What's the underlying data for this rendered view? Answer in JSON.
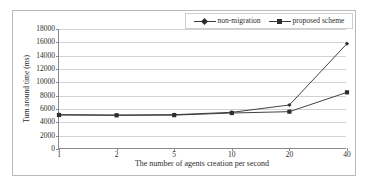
{
  "chart_data": {
    "type": "line",
    "title": "",
    "xlabel": "The number of agents creation per second",
    "ylabel": "Turn around time (ms)",
    "categories": [
      "1",
      "2",
      "5",
      "10",
      "20",
      "40"
    ],
    "ylim": [
      0,
      18000
    ],
    "yticks": [
      0,
      2000,
      4000,
      6000,
      8000,
      10000,
      12000,
      14000,
      16000,
      18000
    ],
    "ytick_labels": [
      "0",
      "2000",
      "4000",
      "6000",
      "8000",
      "10000",
      "12000",
      "14000",
      "16000",
      "18000"
    ],
    "grid": "horizontal",
    "legend_position": "top-right",
    "series": [
      {
        "name": "non-migration",
        "marker": "diamond",
        "color": "#2e2e2e",
        "values": [
          5150,
          5100,
          5150,
          5500,
          6600,
          15800
        ]
      },
      {
        "name": "proposed scheme",
        "marker": "square",
        "color": "#2e2e2e",
        "values": [
          5100,
          5050,
          5080,
          5400,
          5600,
          8500
        ]
      }
    ]
  },
  "legend": {
    "entries": [
      {
        "label": "non-migration"
      },
      {
        "label": "proposed scheme"
      }
    ]
  },
  "axes": {
    "y_title": "Turn around time (ms)",
    "x_title": "The number of agents creation per second"
  }
}
